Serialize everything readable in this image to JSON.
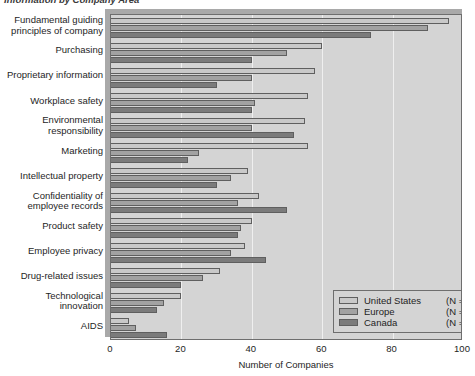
{
  "figure": {
    "title": "Information by Company Area",
    "xaxis_title": "Number of Companies",
    "xticks": [
      "0",
      "20",
      "40",
      "60",
      "80",
      "100"
    ]
  },
  "legend": {
    "entries": [
      {
        "label": "United States",
        "n": "(N = 157)",
        "color": "#c9c9c9",
        "key": "us"
      },
      {
        "label": "Europe",
        "n": "(N = 20)",
        "color": "#a2a2a2",
        "key": "europe"
      },
      {
        "label": "Canada",
        "n": "(N = 23)",
        "color": "#7b7b7b",
        "key": "canada"
      }
    ]
  },
  "chart_data": {
    "type": "bar",
    "orientation": "horizontal",
    "title": "Information by Company Area",
    "xlabel": "Number of Companies",
    "ylabel": "",
    "xlim": [
      0,
      100
    ],
    "xticks": [
      0,
      20,
      40,
      60,
      80,
      100
    ],
    "grid": true,
    "legend_position": "bottom-right",
    "categories": [
      "Fundamental guiding\nprinciples of company",
      "Purchasing",
      "Proprietary information",
      "Workplace safety",
      "Environmental\nresponsibility",
      "Marketing",
      "Intellectual property",
      "Confidentiality of\nemployee records",
      "Product safety",
      "Employee privacy",
      "Drug-related issues",
      "Technological\ninnovation",
      "AIDS"
    ],
    "series": [
      {
        "name": "United States",
        "color": "#c9c9c9",
        "values": [
          96,
          60,
          58,
          56,
          55,
          56,
          39,
          42,
          40,
          38,
          31,
          20,
          5
        ]
      },
      {
        "name": "Europe",
        "color": "#a2a2a2",
        "values": [
          90,
          50,
          40,
          41,
          40,
          25,
          34,
          36,
          37,
          34,
          26,
          15,
          7
        ]
      },
      {
        "name": "Canada",
        "color": "#7b7b7b",
        "values": [
          74,
          40,
          30,
          40,
          52,
          22,
          30,
          50,
          36,
          44,
          20,
          13,
          16
        ]
      }
    ]
  }
}
